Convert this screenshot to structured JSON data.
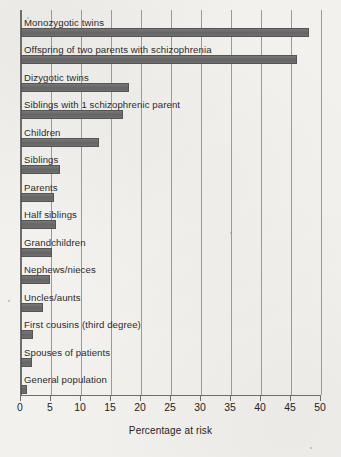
{
  "chart_data": {
    "type": "bar",
    "orientation": "horizontal",
    "title": "",
    "xlabel": "Percentage at risk",
    "ylabel": "",
    "xlim": [
      0,
      50
    ],
    "xticks": [
      0,
      5,
      10,
      15,
      20,
      25,
      30,
      35,
      40,
      45,
      50
    ],
    "grid": "vertical",
    "legend": "none",
    "bar_color": "#6b6b6b",
    "categories": [
      "Monozygotic twins",
      "Offspring of two parents with schizophrenia",
      "Dizygotic twins",
      "Siblings with 1 schizophrenic parent",
      "Children",
      "Siblings",
      "Parents",
      "Half siblings",
      "Grandchildren",
      "Nephews/nieces",
      "Uncles/aunts",
      "First cousins (third degree)",
      "Spouses of patients",
      "General population"
    ],
    "values": [
      48,
      46,
      18,
      17,
      13,
      6.5,
      5.5,
      5.8,
      5.2,
      4.8,
      3.6,
      2,
      1.8,
      1
    ]
  },
  "axis": {
    "tick_labels": [
      "0",
      "5",
      "10",
      "15",
      "20",
      "25",
      "30",
      "35",
      "40",
      "45",
      "50"
    ]
  }
}
